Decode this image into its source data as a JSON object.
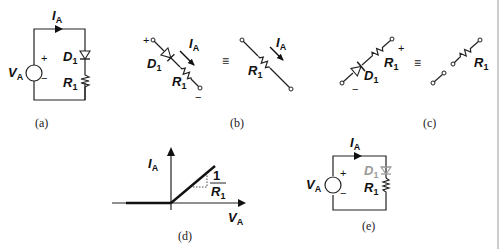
{
  "figure": {
    "panels": [
      {
        "id": "a",
        "caption": "(a)",
        "labels": {
          "current": "I",
          "current_sub": "A",
          "voltage": "V",
          "voltage_sub": "A",
          "diode": "D",
          "diode_sub": "1",
          "resistor": "R",
          "resistor_sub": "1",
          "plus": "+",
          "minus": "−"
        }
      },
      {
        "id": "b",
        "caption": "(b)",
        "labels": {
          "plus": "+",
          "minus": "−",
          "diode": "D",
          "diode_sub": "1",
          "resistor": "R",
          "resistor_sub": "1",
          "current": "I",
          "current_sub": "A",
          "equiv": "≡",
          "eq_resistor": "R",
          "eq_resistor_sub": "1",
          "eq_current": "I",
          "eq_current_sub": "A"
        }
      },
      {
        "id": "c",
        "caption": "(c)",
        "labels": {
          "plus": "+",
          "minus": "−",
          "diode": "D",
          "diode_sub": "1",
          "resistor": "R",
          "resistor_sub": "1",
          "equiv": "≡",
          "eq_resistor": "R",
          "eq_resistor_sub": "1"
        }
      },
      {
        "id": "d",
        "caption": "(d)",
        "labels": {
          "y_axis": "I",
          "y_axis_sub": "A",
          "x_axis": "V",
          "x_axis_sub": "A",
          "slope_num": "1",
          "slope_den": "R",
          "slope_den_sub": "1"
        }
      },
      {
        "id": "e",
        "caption": "(e)",
        "labels": {
          "current": "I",
          "current_sub": "A",
          "voltage": "V",
          "voltage_sub": "A",
          "diode": "D",
          "diode_sub": "1",
          "resistor": "R",
          "resistor_sub": "1",
          "plus": "+",
          "minus": "−"
        }
      }
    ],
    "colors": {
      "ink": "#222222",
      "faded": "#9a9a9a",
      "border": "#bbbbbb"
    }
  }
}
